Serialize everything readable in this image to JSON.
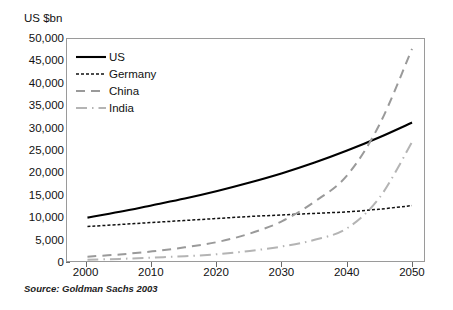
{
  "axis_title": "US $bn",
  "source_note": "Source:  Goldman Sachs 2003",
  "legend": {
    "items": [
      {
        "label": "US",
        "style": "solid",
        "color": "#000000"
      },
      {
        "label": "Germany",
        "style": "fine-dashed",
        "color": "#111111"
      },
      {
        "label": "China",
        "style": "long-dashed",
        "color": "#9a9a9a"
      },
      {
        "label": "India",
        "style": "dash-dot",
        "color": "#b4b4b4"
      }
    ]
  },
  "chart_data": {
    "type": "line",
    "title": "",
    "subtitle": "",
    "xlabel": "",
    "ylabel": "US $bn",
    "xlim": [
      1997,
      2052
    ],
    "ylim": [
      0,
      50000
    ],
    "ytick_labels": [
      "50,000",
      "45,000",
      "40,000",
      "35,000",
      "30,000",
      "25,000",
      "20,000",
      "15,000",
      "10,000",
      "5,000",
      "0"
    ],
    "ytick_values": [
      50000,
      45000,
      40000,
      35000,
      30000,
      25000,
      20000,
      15000,
      10000,
      5000,
      0
    ],
    "xtick_labels": [
      "2000",
      "2010",
      "2020",
      "2030",
      "2040",
      "2050"
    ],
    "xtick_values": [
      2000,
      2010,
      2020,
      2030,
      2040,
      2050
    ],
    "grid": false,
    "legend_position": "upper-left inside",
    "x": [
      2000,
      2005,
      2010,
      2015,
      2020,
      2025,
      2030,
      2035,
      2040,
      2045,
      2050
    ],
    "series": [
      {
        "name": "US",
        "style": "solid",
        "color": "#000000",
        "width": 2.1,
        "values": [
          10000,
          11300,
          12800,
          14300,
          16000,
          17900,
          20000,
          22400,
          25100,
          28100,
          31400
        ]
      },
      {
        "name": "Germany",
        "style": "fine-dashed",
        "color": "#111111",
        "width": 1.5,
        "values": [
          8000,
          8450,
          8900,
          9350,
          9800,
          10250,
          10600,
          10950,
          11300,
          11900,
          12700
        ]
      },
      {
        "name": "China",
        "style": "long-dashed",
        "color": "#9a9a9a",
        "width": 2.0,
        "values": [
          1200,
          1700,
          2400,
          3300,
          4500,
          6400,
          9200,
          13600,
          19500,
          31000,
          48000
        ]
      },
      {
        "name": "India",
        "style": "dash-dot",
        "color": "#b4b4b4",
        "width": 2.0,
        "values": [
          500,
          700,
          1000,
          1300,
          1750,
          2500,
          3500,
          5000,
          7600,
          14500,
          27000
        ]
      }
    ]
  }
}
